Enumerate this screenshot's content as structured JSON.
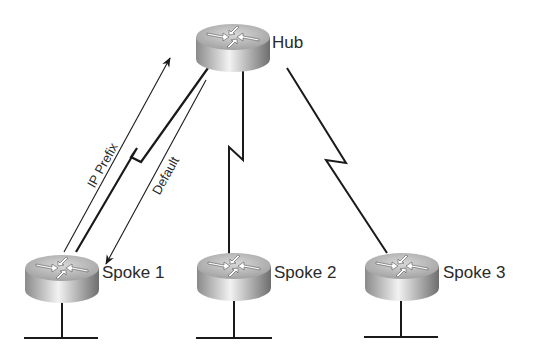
{
  "diagram": {
    "nodes": [
      {
        "id": "hub",
        "label": "Hub",
        "type": "router"
      },
      {
        "id": "spoke1",
        "label": "Spoke 1",
        "type": "router"
      },
      {
        "id": "spoke2",
        "label": "Spoke 2",
        "type": "router"
      },
      {
        "id": "spoke3",
        "label": "Spoke 3",
        "type": "router"
      }
    ],
    "links": [
      {
        "from": "spoke1",
        "to": "hub",
        "type": "serial"
      },
      {
        "from": "spoke2",
        "to": "hub",
        "type": "serial"
      },
      {
        "from": "spoke3",
        "to": "hub",
        "type": "serial"
      }
    ],
    "annotations": [
      {
        "text": "IP Prefix",
        "direction": "spoke1-to-hub"
      },
      {
        "text": "Default",
        "direction": "hub-to-spoke1"
      }
    ],
    "colors": {
      "line": "#1a1a1a",
      "text": "#2a2a2a",
      "router_light": "#e8e8e8",
      "router_dark": "#7a7a7a"
    }
  }
}
